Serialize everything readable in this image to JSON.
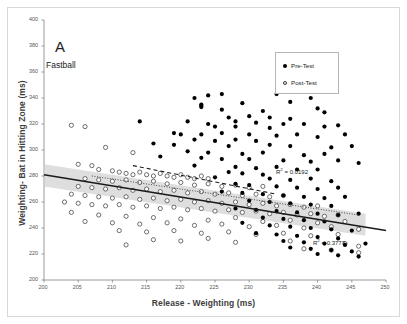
{
  "figure": {
    "panel_letter": "A",
    "series_name": "Fastball"
  },
  "legend": {
    "items": [
      {
        "label": "Pre-Test",
        "marker": "filled-circle-icon"
      },
      {
        "label": "Post-Test",
        "marker": "open-circle-icon"
      }
    ]
  },
  "annotations": {
    "r2_pre_prefix": "R",
    "r2_pre_sup": "2",
    "r2_pre_value": " = 0.0192",
    "r2_post_prefix": "R",
    "r2_post_sup": "2",
    "r2_post_value": " = 0.3777"
  },
  "colors": {
    "pre_test": "#000000",
    "post_test": "#ffffff",
    "post_test_stroke": "#333333",
    "band": "#c9c9c9",
    "fit_solid": "#1a1a1a",
    "fit_dashed": "#1a1a1a",
    "fit_dotted": "#4a4a4a",
    "axis": "#808080",
    "frame": "#d8d8d8"
  },
  "chart_data": {
    "type": "scatter",
    "title": "A  Fastball",
    "xlabel": "Release - Weighting (ms)",
    "ylabel": "Weighting- Bat in Hitting Zone (ms)",
    "xlim": [
      200,
      250
    ],
    "ylim": [
      200,
      400
    ],
    "xticks": [
      200,
      205,
      210,
      215,
      220,
      225,
      230,
      235,
      240,
      245,
      250
    ],
    "yticks": [
      200,
      220,
      240,
      260,
      280,
      300,
      320,
      340,
      360,
      380,
      400
    ],
    "grid": false,
    "legend_position": "top-right",
    "series": [
      {
        "name": "Pre-Test",
        "marker": "filled-circle",
        "r_squared": 0.0192,
        "trendline": {
          "style": "dashed",
          "x": [
            213,
            234
          ],
          "y": [
            288,
            266
          ]
        },
        "points": [
          [
            222,
            340
          ],
          [
            224,
            342
          ],
          [
            226,
            343
          ],
          [
            234,
            343
          ],
          [
            223,
            335
          ],
          [
            223,
            334
          ],
          [
            223,
            333
          ],
          [
            229,
            336
          ],
          [
            236,
            337
          ],
          [
            239,
            340
          ],
          [
            232,
            330
          ],
          [
            226,
            331
          ],
          [
            240,
            332
          ],
          [
            241,
            329
          ],
          [
            227,
            325
          ],
          [
            230,
            326
          ],
          [
            233,
            325
          ],
          [
            236,
            324
          ],
          [
            221,
            322
          ],
          [
            224,
            320
          ],
          [
            228,
            322
          ],
          [
            231,
            321
          ],
          [
            235,
            320
          ],
          [
            238,
            320
          ],
          [
            214,
            322
          ],
          [
            225,
            318
          ],
          [
            228,
            318
          ],
          [
            233,
            317
          ],
          [
            241,
            318
          ],
          [
            243,
            319
          ],
          [
            219,
            313
          ],
          [
            220,
            312
          ],
          [
            223,
            312
          ],
          [
            226,
            313
          ],
          [
            230,
            312
          ],
          [
            234,
            311
          ],
          [
            237,
            312
          ],
          [
            240,
            310
          ],
          [
            244,
            312
          ],
          [
            222,
            308
          ],
          [
            225,
            307
          ],
          [
            228,
            308
          ],
          [
            231,
            307
          ],
          [
            216,
            305
          ],
          [
            219,
            304
          ],
          [
            227,
            303
          ],
          [
            233,
            304
          ],
          [
            236,
            303
          ],
          [
            242,
            302
          ],
          [
            245,
            303
          ],
          [
            221,
            299
          ],
          [
            224,
            298
          ],
          [
            229,
            297
          ],
          [
            232,
            298
          ],
          [
            238,
            296
          ],
          [
            241,
            297
          ],
          [
            217,
            295
          ],
          [
            223,
            294
          ],
          [
            226,
            293
          ],
          [
            230,
            293
          ],
          [
            235,
            292
          ],
          [
            239,
            291
          ],
          [
            243,
            292
          ],
          [
            246,
            290
          ],
          [
            222,
            288
          ],
          [
            228,
            287
          ],
          [
            231,
            286
          ],
          [
            234,
            287
          ],
          [
            237,
            285
          ],
          [
            240,
            285
          ],
          [
            227,
            283
          ],
          [
            229,
            282
          ],
          [
            232,
            281
          ],
          [
            225,
            279
          ],
          [
            233,
            278
          ],
          [
            236,
            277
          ],
          [
            239,
            278
          ],
          [
            242,
            276
          ],
          [
            228,
            274
          ],
          [
            230,
            273
          ],
          [
            234,
            272
          ],
          [
            237,
            271
          ],
          [
            240,
            270
          ],
          [
            243,
            271
          ],
          [
            226,
            268
          ],
          [
            229,
            267
          ],
          [
            232,
            266
          ],
          [
            235,
            265
          ],
          [
            238,
            264
          ],
          [
            241,
            263
          ],
          [
            244,
            264
          ],
          [
            230,
            261
          ],
          [
            233,
            260
          ],
          [
            236,
            259
          ],
          [
            239,
            258
          ],
          [
            242,
            257
          ],
          [
            228,
            255
          ],
          [
            231,
            254
          ],
          [
            234,
            253
          ],
          [
            237,
            252
          ],
          [
            240,
            251
          ],
          [
            243,
            250
          ],
          [
            246,
            251
          ],
          [
            232,
            248
          ],
          [
            235,
            247
          ],
          [
            238,
            246
          ],
          [
            241,
            245
          ],
          [
            229,
            244
          ],
          [
            233,
            242
          ],
          [
            236,
            241
          ],
          [
            239,
            240
          ],
          [
            242,
            239
          ],
          [
            245,
            238
          ],
          [
            231,
            236
          ],
          [
            234,
            235
          ],
          [
            237,
            234
          ],
          [
            240,
            233
          ],
          [
            243,
            232
          ],
          [
            235,
            230
          ],
          [
            238,
            229
          ],
          [
            241,
            228
          ],
          [
            244,
            227
          ],
          [
            247,
            228
          ],
          [
            236,
            225
          ],
          [
            239,
            224
          ],
          [
            242,
            223
          ],
          [
            245,
            222
          ],
          [
            240,
            220
          ],
          [
            243,
            219
          ],
          [
            246,
            218
          ]
        ]
      },
      {
        "name": "Post-Test",
        "marker": "open-circle",
        "r_squared": 0.3777,
        "trendline": {
          "style": "solid",
          "x": [
            200,
            250
          ],
          "y": [
            281,
            238
          ]
        },
        "band": {
          "x": [
            200,
            247
          ],
          "upper": [
            289,
            251
          ],
          "lower": [
            272,
            234
          ]
        },
        "dotted_fit": {
          "style": "dotted",
          "x": [
            207,
            246
          ],
          "y": [
            280,
            250
          ]
        },
        "points": [
          [
            204,
            319
          ],
          [
            206,
            318
          ],
          [
            209,
            302
          ],
          [
            213,
            298
          ],
          [
            205,
            289
          ],
          [
            207,
            288
          ],
          [
            208,
            285
          ],
          [
            210,
            284
          ],
          [
            211,
            283
          ],
          [
            212,
            282
          ],
          [
            213,
            281
          ],
          [
            214,
            283
          ],
          [
            215,
            281
          ],
          [
            216,
            280
          ],
          [
            217,
            282
          ],
          [
            218,
            280
          ],
          [
            219,
            279
          ],
          [
            220,
            281
          ],
          [
            221,
            279
          ],
          [
            222,
            278
          ],
          [
            223,
            280
          ],
          [
            224,
            278
          ],
          [
            206,
            278
          ],
          [
            208,
            277
          ],
          [
            210,
            276
          ],
          [
            212,
            277
          ],
          [
            214,
            275
          ],
          [
            216,
            276
          ],
          [
            218,
            274
          ],
          [
            220,
            275
          ],
          [
            222,
            273
          ],
          [
            224,
            274
          ],
          [
            226,
            272
          ],
          [
            228,
            273
          ],
          [
            230,
            271
          ],
          [
            232,
            272
          ],
          [
            205,
            272
          ],
          [
            207,
            271
          ],
          [
            209,
            270
          ],
          [
            211,
            271
          ],
          [
            213,
            269
          ],
          [
            215,
            270
          ],
          [
            217,
            268
          ],
          [
            219,
            269
          ],
          [
            221,
            267
          ],
          [
            223,
            268
          ],
          [
            225,
            266
          ],
          [
            227,
            267
          ],
          [
            229,
            265
          ],
          [
            231,
            266
          ],
          [
            233,
            264
          ],
          [
            235,
            265
          ],
          [
            204,
            266
          ],
          [
            206,
            265
          ],
          [
            208,
            264
          ],
          [
            210,
            263
          ],
          [
            212,
            264
          ],
          [
            214,
            262
          ],
          [
            216,
            263
          ],
          [
            218,
            261
          ],
          [
            220,
            262
          ],
          [
            222,
            260
          ],
          [
            224,
            261
          ],
          [
            226,
            259
          ],
          [
            228,
            260
          ],
          [
            230,
            258
          ],
          [
            232,
            259
          ],
          [
            234,
            257
          ],
          [
            236,
            258
          ],
          [
            238,
            256
          ],
          [
            240,
            257
          ],
          [
            203,
            260
          ],
          [
            205,
            259
          ],
          [
            207,
            258
          ],
          [
            209,
            257
          ],
          [
            211,
            258
          ],
          [
            213,
            256
          ],
          [
            215,
            257
          ],
          [
            217,
            255
          ],
          [
            219,
            256
          ],
          [
            221,
            254
          ],
          [
            223,
            255
          ],
          [
            225,
            253
          ],
          [
            227,
            254
          ],
          [
            229,
            252
          ],
          [
            231,
            253
          ],
          [
            233,
            251
          ],
          [
            235,
            252
          ],
          [
            237,
            250
          ],
          [
            239,
            251
          ],
          [
            241,
            249
          ],
          [
            243,
            250
          ],
          [
            204,
            252
          ],
          [
            208,
            250
          ],
          [
            212,
            249
          ],
          [
            216,
            248
          ],
          [
            220,
            247
          ],
          [
            224,
            246
          ],
          [
            228,
            248
          ],
          [
            232,
            245
          ],
          [
            236,
            246
          ],
          [
            240,
            244
          ],
          [
            244,
            245
          ],
          [
            206,
            245
          ],
          [
            210,
            244
          ],
          [
            214,
            243
          ],
          [
            218,
            244
          ],
          [
            222,
            242
          ],
          [
            226,
            243
          ],
          [
            230,
            241
          ],
          [
            234,
            242
          ],
          [
            238,
            240
          ],
          [
            242,
            241
          ],
          [
            246,
            239
          ],
          [
            211,
            238
          ],
          [
            215,
            237
          ],
          [
            219,
            238
          ],
          [
            223,
            236
          ],
          [
            227,
            237
          ],
          [
            231,
            235
          ],
          [
            235,
            236
          ],
          [
            239,
            234
          ],
          [
            243,
            235
          ],
          [
            216,
            231
          ],
          [
            220,
            230
          ],
          [
            224,
            232
          ],
          [
            228,
            229
          ],
          [
            236,
            230
          ],
          [
            244,
            228
          ],
          [
            246,
            226
          ],
          [
            212,
            227
          ],
          [
            238,
            224
          ],
          [
            242,
            223
          ],
          [
            246,
            221
          ]
        ]
      }
    ]
  }
}
